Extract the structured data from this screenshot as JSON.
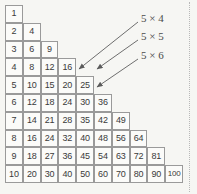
{
  "figure": {
    "type": "table",
    "colors": {
      "background": "#f6f6f3",
      "cell_fill": "#fbfbf9",
      "cell_border": "#9a9a9a",
      "text": "#3a3a3a",
      "annotation": "#4a4a4a",
      "arrow": "#6e6e6e"
    },
    "geometry": {
      "origin_x": 5,
      "origin_y": 5,
      "cell_w": 17.8,
      "cell_h": 17.8,
      "rows": 10
    }
  },
  "chart_data": {
    "type": "table",
    "title": "",
    "xlabel": "",
    "ylabel": "",
    "rows": [
      [
        1
      ],
      [
        2,
        4
      ],
      [
        3,
        6,
        9
      ],
      [
        4,
        8,
        12,
        16
      ],
      [
        5,
        10,
        15,
        20,
        25
      ],
      [
        6,
        12,
        18,
        24,
        30,
        36
      ],
      [
        7,
        14,
        21,
        28,
        35,
        42,
        49
      ],
      [
        8,
        16,
        24,
        32,
        40,
        48,
        56,
        64
      ],
      [
        9,
        18,
        27,
        36,
        45,
        54,
        63,
        72,
        81
      ],
      [
        10,
        20,
        30,
        40,
        50,
        60,
        70,
        80,
        90,
        100
      ]
    ]
  },
  "annotations": [
    {
      "label": "5 × 4",
      "label_x": 141,
      "label_y": 13,
      "target_value": 20,
      "target_row": 5,
      "target_col": 4,
      "arrow": {
        "x1": 138,
        "y1": 22,
        "x2": 79,
        "y2": 69
      }
    },
    {
      "label": "5 × 5",
      "label_x": 141,
      "label_y": 31,
      "target_value": 25,
      "target_row": 5,
      "target_col": 5,
      "arrow": {
        "x1": 138,
        "y1": 40,
        "x2": 97,
        "y2": 69
      }
    },
    {
      "label": "5 × 6",
      "label_x": 141,
      "label_y": 50,
      "target_value": 30,
      "target_row": 6,
      "target_col": 5,
      "arrow": {
        "x1": 138,
        "y1": 59,
        "x2": 97,
        "y2": 87
      }
    }
  ]
}
